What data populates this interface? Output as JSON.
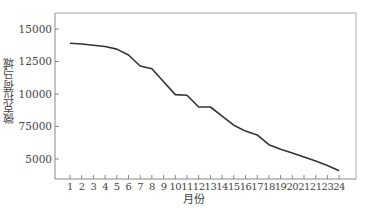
{
  "chart_data": {
    "type": "line",
    "title": "",
    "xlabel": "月份",
    "ylabel": "微克拉荷马城",
    "categories": [
      "1",
      "2",
      "3",
      "4",
      "5",
      "6",
      "7",
      "8",
      "9",
      "10",
      "11",
      "12",
      "13",
      "14",
      "15",
      "16",
      "17",
      "18",
      "19",
      "20",
      "21",
      "21",
      "23",
      "24"
    ],
    "x": [
      1,
      2,
      3,
      4,
      5,
      6,
      7,
      8,
      9,
      10,
      11,
      12,
      13,
      14,
      15,
      16,
      17,
      18,
      19,
      20,
      21,
      22,
      23,
      24
    ],
    "values": [
      13900,
      13850,
      13750,
      13650,
      13450,
      13000,
      12150,
      11950,
      10950,
      9950,
      9900,
      9000,
      9000,
      8300,
      7600,
      7150,
      6850,
      6100,
      5750,
      5450,
      5150,
      4850,
      4500,
      4100
    ],
    "ytick_values": [
      15000,
      12500,
      10000,
      7500,
      5000
    ],
    "ytick_labels": [
      "15000",
      "12500",
      "10000",
      "75000",
      "5000"
    ],
    "ylim": [
      3500,
      16500
    ],
    "xlim": [
      0,
      25.5
    ],
    "grid": false,
    "legend": null,
    "line_color": "#333333"
  },
  "axes": {
    "x_title": "月份",
    "y_title": "微克拉荷马城"
  }
}
